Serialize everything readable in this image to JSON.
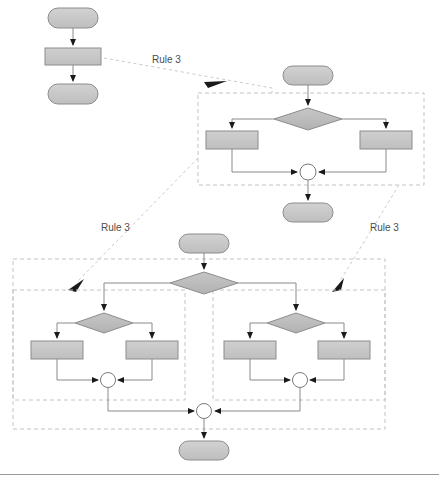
{
  "diagram": {
    "type": "flowchart-transformation",
    "colors": {
      "terminator_fill": "#c8c8c8",
      "terminator_stroke": "#8c8c8c",
      "process_fill": "#c8c8c8",
      "process_stroke": "#8c8c8c",
      "decision_fill": "#bdbdbd",
      "decision_stroke": "#8c8c8c",
      "merge_fill": "#ffffff",
      "merge_stroke": "#7a7a7a",
      "connector_stroke": "#8a8a8a",
      "dashed_box_stroke": "#c0c0c0",
      "rule_arrow_stroke": "#c9c9c9",
      "rule_label_color": "#4d4d4d",
      "divider_stroke": "#9a9a9a",
      "background": "#ffffff"
    },
    "rule_labels": [
      {
        "id": "rule-label-top",
        "text": "Rule 3",
        "x": 152,
        "y": 63
      },
      {
        "id": "rule-label-left",
        "text": "Rule 3",
        "x": 101,
        "y": 231
      },
      {
        "id": "rule-label-right",
        "text": "Rule 3",
        "x": 370,
        "y": 231
      }
    ],
    "panels": [
      {
        "id": "panel-source",
        "name": "source-flowchart",
        "nodes": [
          {
            "id": "src-start",
            "type": "terminator",
            "label": "",
            "x": 48,
            "y": 8,
            "w": 50,
            "h": 20
          },
          {
            "id": "src-process",
            "type": "process",
            "label": "",
            "x": 45,
            "y": 48,
            "w": 56,
            "h": 16
          },
          {
            "id": "src-end",
            "type": "terminator",
            "label": "",
            "x": 48,
            "y": 84,
            "w": 50,
            "h": 20
          }
        ]
      },
      {
        "id": "panel-middle",
        "name": "middle-flowchart",
        "dashed_boxes": [
          {
            "id": "mid-box-outer",
            "x": 198,
            "y": 93,
            "w": 226,
            "h": 92
          }
        ],
        "nodes": [
          {
            "id": "mid-start",
            "type": "terminator",
            "label": "",
            "x": 283,
            "y": 66,
            "w": 50,
            "h": 19
          },
          {
            "id": "mid-decision",
            "type": "decision",
            "label": "",
            "x": 274,
            "y": 108,
            "w": 68,
            "h": 22
          },
          {
            "id": "mid-proc-l",
            "type": "process",
            "label": "",
            "x": 206,
            "y": 131,
            "w": 52,
            "h": 18
          },
          {
            "id": "mid-proc-r",
            "type": "process",
            "label": "",
            "x": 360,
            "y": 131,
            "w": 52,
            "h": 18
          },
          {
            "id": "mid-merge",
            "type": "merge",
            "label": "",
            "cx": 308,
            "cy": 172,
            "r": 8
          },
          {
            "id": "mid-end",
            "type": "terminator",
            "label": "",
            "x": 283,
            "y": 203,
            "w": 50,
            "h": 19
          }
        ]
      },
      {
        "id": "panel-bottom",
        "name": "bottom-flowchart",
        "dashed_boxes": [
          {
            "id": "bot-box-outer",
            "x": 13,
            "y": 259,
            "w": 372,
            "h": 170
          },
          {
            "id": "bot-box-left",
            "x": 13,
            "y": 290,
            "w": 172,
            "h": 110
          },
          {
            "id": "bot-box-right",
            "x": 213,
            "y": 290,
            "w": 172,
            "h": 110
          }
        ],
        "nodes": [
          {
            "id": "bot-start",
            "type": "terminator",
            "label": "",
            "x": 174,
            "y": 234,
            "w": 50,
            "h": 19
          },
          {
            "id": "bot-decision",
            "type": "decision",
            "label": "",
            "x": 165,
            "y": 272,
            "w": 68,
            "h": 22
          },
          {
            "id": "bot-dec-l",
            "type": "decision",
            "label": "",
            "x": 71,
            "y": 313,
            "w": 58,
            "h": 20
          },
          {
            "id": "bot-dec-r",
            "type": "decision",
            "label": "",
            "x": 263,
            "y": 313,
            "w": 58,
            "h": 20
          },
          {
            "id": "bot-proc-ll",
            "type": "process",
            "label": "",
            "x": 31,
            "y": 341,
            "w": 52,
            "h": 18
          },
          {
            "id": "bot-proc-lr",
            "type": "process",
            "label": "",
            "x": 126,
            "y": 341,
            "w": 52,
            "h": 18
          },
          {
            "id": "bot-proc-rl",
            "type": "process",
            "label": "",
            "x": 224,
            "y": 341,
            "w": 52,
            "h": 18
          },
          {
            "id": "bot-proc-rr",
            "type": "process",
            "label": "",
            "x": 318,
            "y": 341,
            "w": 52,
            "h": 18
          },
          {
            "id": "bot-merge-l",
            "type": "merge",
            "label": "",
            "cx": 108,
            "cy": 380,
            "r": 7
          },
          {
            "id": "bot-merge-r",
            "type": "merge",
            "label": "",
            "cx": 300,
            "cy": 380,
            "r": 7
          },
          {
            "id": "bot-merge-c",
            "type": "merge",
            "label": "",
            "cx": 204,
            "cy": 411,
            "r": 7
          },
          {
            "id": "bot-end",
            "type": "terminator",
            "label": "",
            "x": 179,
            "y": 441,
            "w": 50,
            "h": 19
          }
        ]
      }
    ],
    "divider": {
      "id": "bottom-divider",
      "x1": 0,
      "y1": 474,
      "x2": 439,
      "y2": 474
    }
  }
}
